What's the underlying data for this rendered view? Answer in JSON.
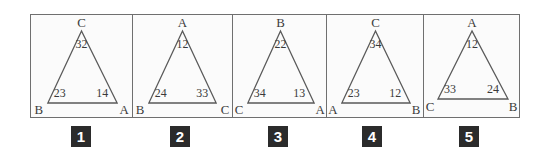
{
  "figure": {
    "caption_numbers": [
      "1",
      "2",
      "3",
      "4",
      "5"
    ],
    "colors": {
      "frame": "#6f6f6f",
      "triangle_stroke": "#5a5a5a",
      "text": "#3a3a3a",
      "badge_background": "#2b2b2b",
      "badge_text": "#ffffff",
      "panel_background": "#fbfbfb"
    }
  },
  "panels": [
    {
      "number": "1",
      "apex_label": "C",
      "apex_angle": "32",
      "left_label": "B",
      "left_angle": "23",
      "right_label": "A",
      "right_angle": "14"
    },
    {
      "number": "2",
      "apex_label": "A",
      "apex_angle": "12",
      "left_label": "B",
      "left_angle": "24",
      "right_label": "C",
      "right_angle": "33"
    },
    {
      "number": "3",
      "apex_label": "B",
      "apex_angle": "22",
      "left_label": "C",
      "left_angle": "34",
      "right_label": "A",
      "right_angle": "13"
    },
    {
      "number": "4",
      "apex_label": "C",
      "apex_angle": "34",
      "left_label": "A",
      "left_angle": "23",
      "right_label": "B",
      "right_angle": "12"
    },
    {
      "number": "5",
      "apex_label": "A",
      "apex_angle": "12",
      "left_label": "C",
      "left_angle": "33",
      "right_label": "B",
      "right_angle": "24"
    }
  ]
}
